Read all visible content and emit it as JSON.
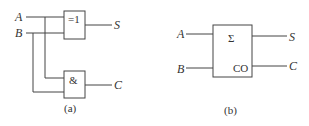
{
  "diagram_a": {
    "caption": "(a)",
    "inputs": [
      "A",
      "B"
    ],
    "xor_gate": {
      "symbol": "=1",
      "output": "S"
    },
    "and_gate": {
      "symbol": "&",
      "output": "C"
    }
  },
  "diagram_b": {
    "caption": "(b)",
    "inputs": [
      "A",
      "B"
    ],
    "block": {
      "sum_symbol": "Σ",
      "carry_symbol": "CO"
    },
    "outputs": [
      "S",
      "C"
    ]
  }
}
